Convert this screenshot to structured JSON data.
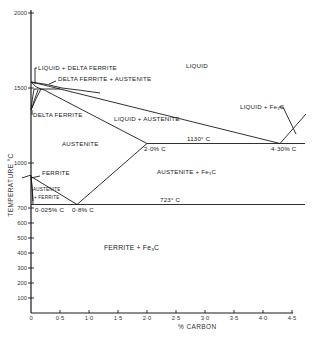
{
  "diagram": {
    "y_axis": {
      "label": "TEMPERATURE °C",
      "ticks": [
        "2000",
        "1500",
        "1000",
        "700",
        "600",
        "500",
        "400",
        "300",
        "200",
        "100"
      ]
    },
    "x_axis": {
      "label": "% CARBON",
      "ticks": [
        "0",
        "0·5",
        "1·0",
        "1·5",
        "2·0",
        "2·5",
        "3·0",
        "3·5",
        "4·0",
        "4·5"
      ]
    },
    "regions": {
      "liquid": "LIQUID",
      "liquid_delta": "LIQUID + DELTA FERRITE",
      "delta_austenite": "DELTA FERRITE + AUSTENITE",
      "delta": "DELTA FERRITE",
      "liquid_austenite": "LIQUID + AUSTENITE",
      "liquid_fe3c": "LIQUID + Fe₃C",
      "austenite": "AUSTENITE",
      "austenite_fe3c": "AUSTENITE + Fe₃C",
      "ferrite": "FERRITE",
      "austenite_ferrite_1": "AUSTENITE",
      "austenite_ferrite_2": "+ FERRITE",
      "ferrite_fe3c": "FERRITE + Fe₃C"
    },
    "annotations": {
      "eutectic_temp": "1130° C",
      "eutectic_comp": "4·30% C",
      "austenite_max": "2·0% C",
      "eutectoid_temp": "723° C",
      "ferrite_max": "0·025% C",
      "eutectoid_comp": "0·8% C"
    }
  }
}
